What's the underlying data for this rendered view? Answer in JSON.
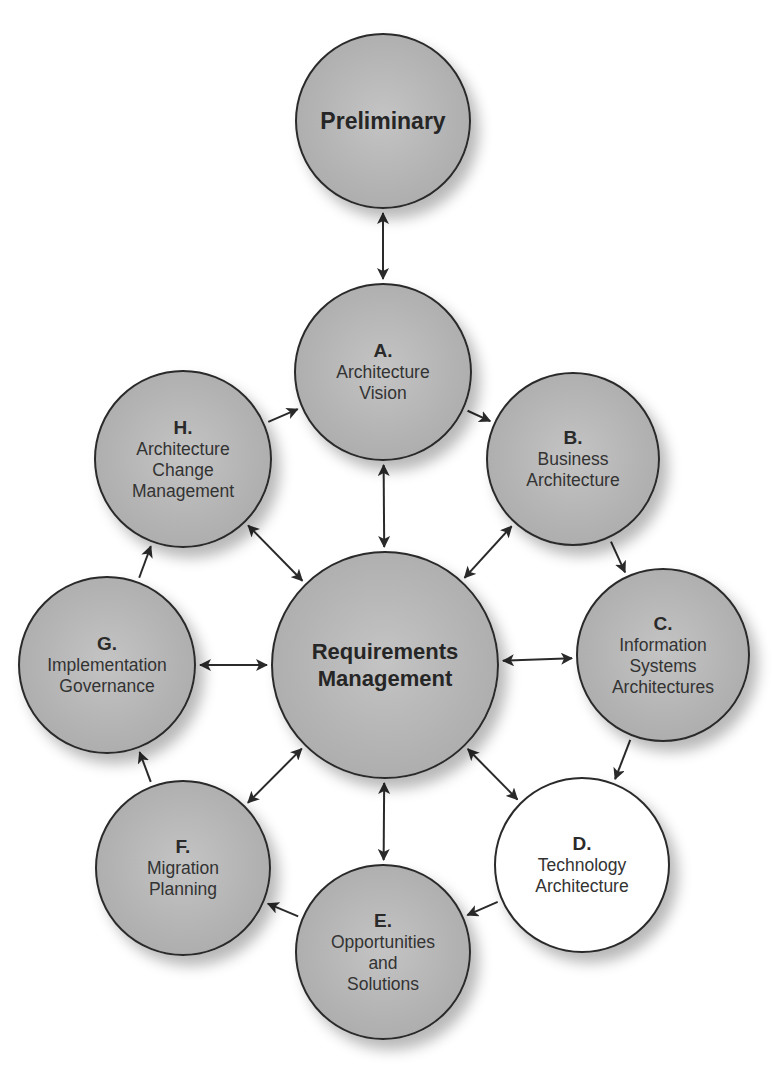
{
  "diagram": {
    "colors": {
      "phase_fill": "#b5b5b5",
      "highlight_fill": "#ffffff",
      "stroke": "#2a2a2a",
      "text": "#2b2b2b"
    },
    "nodes": {
      "preliminary": {
        "letter": "",
        "label": "Preliminary",
        "cx": 383,
        "cy": 121,
        "r": 88,
        "fill": "gray"
      },
      "a": {
        "letter": "A.",
        "label": "Architecture\nVision",
        "cx": 383,
        "cy": 372,
        "r": 89,
        "fill": "gray"
      },
      "b": {
        "letter": "B.",
        "label": "Business\nArchitecture",
        "cx": 573,
        "cy": 459,
        "r": 87,
        "fill": "gray"
      },
      "c": {
        "letter": "C.",
        "label": "Information\nSystems\nArchitectures",
        "cx": 663,
        "cy": 655,
        "r": 87,
        "fill": "gray"
      },
      "d": {
        "letter": "D.",
        "label": "Technology\nArchitecture",
        "cx": 582,
        "cy": 865,
        "r": 88,
        "fill": "white"
      },
      "e": {
        "letter": "E.",
        "label": "Opportunities\nand\nSolutions",
        "cx": 383,
        "cy": 952,
        "r": 88,
        "fill": "gray"
      },
      "f": {
        "letter": "F.",
        "label": "Migration\nPlanning",
        "cx": 183,
        "cy": 868,
        "r": 88,
        "fill": "gray"
      },
      "g": {
        "letter": "G.",
        "label": "Implementation\nGovernance",
        "cx": 107,
        "cy": 665,
        "r": 89,
        "fill": "gray"
      },
      "h": {
        "letter": "H.",
        "label": "Architecture\nChange\nManagement",
        "cx": 183,
        "cy": 459,
        "r": 89,
        "fill": "gray"
      },
      "center": {
        "letter": "",
        "label": "Requirements\nManagement",
        "cx": 385,
        "cy": 665,
        "r": 114,
        "fill": "gray"
      }
    },
    "arrows": [
      {
        "from": "preliminary",
        "to": "a",
        "type": "bidirectional"
      },
      {
        "from": "h",
        "to": "a",
        "type": "forward"
      },
      {
        "from": "a",
        "to": "b",
        "type": "forward"
      },
      {
        "from": "b",
        "to": "c",
        "type": "forward"
      },
      {
        "from": "c",
        "to": "d",
        "type": "forward"
      },
      {
        "from": "d",
        "to": "e",
        "type": "forward"
      },
      {
        "from": "e",
        "to": "f",
        "type": "forward"
      },
      {
        "from": "f",
        "to": "g",
        "type": "forward"
      },
      {
        "from": "g",
        "to": "h",
        "type": "forward"
      },
      {
        "from": "center",
        "to": "a",
        "type": "bidirectional"
      },
      {
        "from": "center",
        "to": "b",
        "type": "bidirectional"
      },
      {
        "from": "center",
        "to": "c",
        "type": "bidirectional"
      },
      {
        "from": "center",
        "to": "d",
        "type": "bidirectional"
      },
      {
        "from": "center",
        "to": "e",
        "type": "bidirectional"
      },
      {
        "from": "center",
        "to": "f",
        "type": "bidirectional"
      },
      {
        "from": "center",
        "to": "g",
        "type": "bidirectional"
      },
      {
        "from": "center",
        "to": "h",
        "type": "bidirectional"
      }
    ]
  }
}
